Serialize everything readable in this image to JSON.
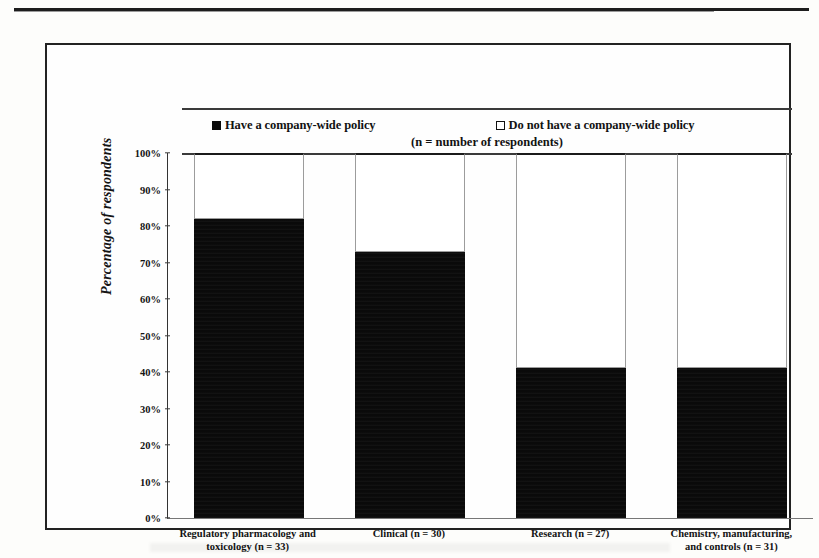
{
  "legend": {
    "have_label": "Have a company-wide policy",
    "donot_label": "Do not have a company-wide policy",
    "note": "(n = number of respondents)",
    "have_swatch": "filled-square-icon",
    "donot_swatch": "open-square-icon"
  },
  "chart_data": {
    "type": "bar",
    "title": "",
    "xlabel": "",
    "ylabel": "Percentage of respondents",
    "ylim": [
      0,
      100
    ],
    "ytick_labels": [
      "100%",
      "90%",
      "80%",
      "70%",
      "60%",
      "50%",
      "40%",
      "30%",
      "20%",
      "10%",
      "0%"
    ],
    "ytick_values": [
      100,
      90,
      80,
      70,
      60,
      50,
      40,
      30,
      20,
      10,
      0
    ],
    "grid": false,
    "legend_position": "top",
    "stacked": true,
    "categories": [
      "Regulatory pharmacology and toxicology (n = 33)",
      "Clinical (n = 30)",
      "Research (n = 27)",
      "Chemistry, manufacturing, and controls (n = 31)"
    ],
    "category_lines": [
      [
        "Regulatory pharmacology and",
        "toxicology (n = 33)"
      ],
      [
        "Clinical (n = 30)",
        ""
      ],
      [
        "Research (n = 27)",
        ""
      ],
      [
        "Chemistry, manufacturing,",
        "and controls (n = 31)"
      ]
    ],
    "series": [
      {
        "name": "Have a company-wide policy",
        "color": "#0a0a0a",
        "values": [
          82,
          73,
          41,
          41
        ]
      },
      {
        "name": "Do not have a company-wide policy",
        "color": "#ffffff",
        "values": [
          18,
          27,
          59,
          59
        ]
      }
    ],
    "respondents": [
      33,
      30,
      27,
      31
    ]
  }
}
